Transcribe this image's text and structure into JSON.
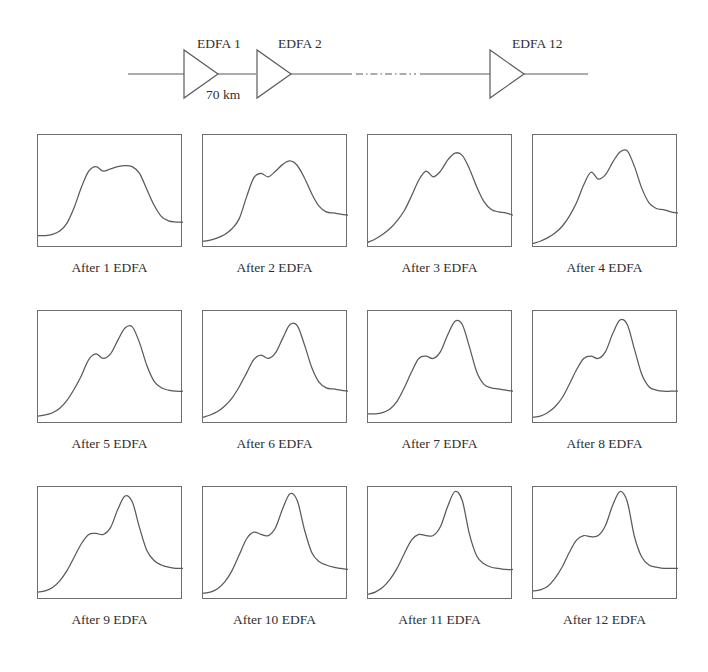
{
  "figure": {
    "stroke_color": "#5a5a5a",
    "frame_color": "#6e6e6e",
    "background_color": "#ffffff"
  },
  "link_diagram": {
    "amplifier_labels": [
      "EDFA 1",
      "EDFA 2",
      "EDFA 12"
    ],
    "span_label": "70 km",
    "ellipsis_style": "dash-dot",
    "amplifier_count_shown": 3,
    "amplifier_symbol": "triangle-right"
  },
  "chart_data": {
    "type": "line",
    "xlabel": "",
    "ylabel": "",
    "xlim": [
      0,
      100
    ],
    "ylim": [
      0,
      100
    ],
    "grid": false,
    "legend": "none",
    "panel_count": 12,
    "panel_columns": 4,
    "panel_rows": 3,
    "x": [
      0,
      5,
      10,
      15,
      20,
      25,
      30,
      35,
      40,
      45,
      50,
      55,
      60,
      65,
      70,
      75,
      80,
      85,
      90,
      95,
      100
    ],
    "panels": [
      {
        "index": 1,
        "caption": "After 1 EDFA",
        "values": [
          11,
          11,
          12,
          15,
          22,
          36,
          54,
          68,
          72,
          68,
          70,
          72,
          73,
          72,
          66,
          52,
          38,
          28,
          24,
          23,
          23
        ]
      },
      {
        "index": 2,
        "caption": "After 2 EDFA",
        "values": [
          6,
          7,
          9,
          12,
          17,
          26,
          45,
          62,
          66,
          63,
          68,
          74,
          77,
          73,
          62,
          48,
          37,
          32,
          31,
          30,
          29
        ]
      },
      {
        "index": 3,
        "caption": "After 3 EDFA",
        "values": [
          5,
          8,
          12,
          17,
          24,
          33,
          46,
          60,
          68,
          63,
          68,
          78,
          84,
          82,
          70,
          54,
          41,
          34,
          32,
          31,
          29
        ]
      },
      {
        "index": 4,
        "caption": "After 4 EDFA",
        "values": [
          4,
          6,
          9,
          13,
          19,
          28,
          40,
          56,
          67,
          61,
          65,
          76,
          85,
          86,
          72,
          53,
          40,
          35,
          34,
          32,
          31
        ]
      },
      {
        "index": 5,
        "caption": "After 5 EDFA",
        "values": [
          7,
          8,
          10,
          14,
          21,
          31,
          43,
          57,
          62,
          58,
          62,
          74,
          85,
          86,
          72,
          52,
          38,
          32,
          30,
          29,
          29
        ]
      },
      {
        "index": 6,
        "caption": "After 6 EDFA",
        "values": [
          6,
          8,
          11,
          16,
          23,
          33,
          45,
          57,
          61,
          58,
          63,
          76,
          88,
          87,
          70,
          50,
          37,
          32,
          31,
          30,
          29
        ]
      },
      {
        "index": 7,
        "caption": "After 7 EDFA",
        "values": [
          9,
          9,
          10,
          13,
          20,
          32,
          46,
          58,
          60,
          58,
          64,
          79,
          91,
          88,
          68,
          46,
          35,
          32,
          31,
          30,
          29
        ]
      },
      {
        "index": 8,
        "caption": "After 8 EDFA",
        "values": [
          6,
          7,
          10,
          15,
          23,
          35,
          48,
          58,
          60,
          58,
          64,
          80,
          92,
          88,
          66,
          44,
          33,
          30,
          29,
          29,
          29
        ]
      },
      {
        "index": 9,
        "caption": "After 9 EDFA",
        "values": [
          7,
          8,
          11,
          17,
          26,
          38,
          50,
          58,
          59,
          58,
          64,
          80,
          92,
          87,
          64,
          44,
          35,
          31,
          29,
          28,
          28
        ]
      },
      {
        "index": 10,
        "caption": "After 10 EDFA",
        "values": [
          6,
          7,
          10,
          16,
          26,
          40,
          54,
          60,
          58,
          57,
          64,
          81,
          94,
          88,
          62,
          42,
          34,
          31,
          29,
          28,
          27
        ]
      },
      {
        "index": 11,
        "caption": "After 11 EDFA",
        "values": [
          5,
          7,
          11,
          18,
          28,
          41,
          53,
          58,
          57,
          57,
          65,
          83,
          96,
          88,
          58,
          39,
          32,
          29,
          28,
          27,
          27
        ]
      },
      {
        "index": 12,
        "caption": "After 12 EDFA",
        "values": [
          8,
          9,
          12,
          19,
          29,
          42,
          53,
          57,
          56,
          57,
          66,
          84,
          96,
          87,
          56,
          38,
          31,
          29,
          28,
          28,
          28
        ]
      }
    ]
  }
}
